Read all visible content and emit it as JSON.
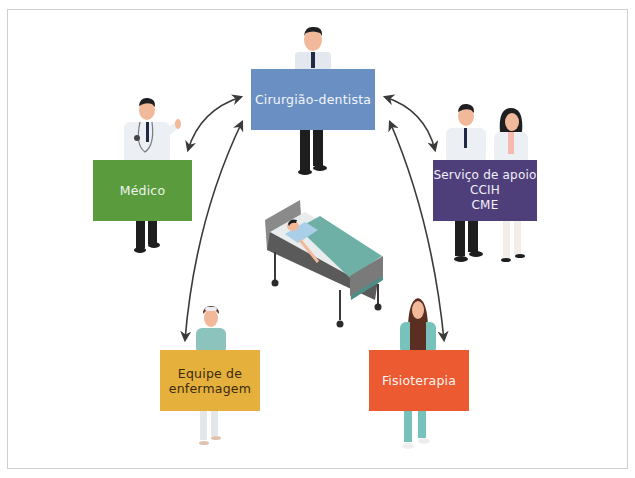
{
  "diagram": {
    "center": {
      "label": "Paciente no leito",
      "icon": "hospital-bed-icon"
    },
    "roles": [
      {
        "id": "dentist",
        "label_lines": [
          "Cirurgião-dentista"
        ],
        "color": "#6a8fc3"
      },
      {
        "id": "medico",
        "label_lines": [
          "Médico"
        ],
        "color": "#5a9b3e"
      },
      {
        "id": "apoio",
        "label_lines": [
          "Serviço de apoio",
          "CCIH",
          "CME"
        ],
        "color": "#4e3f7a"
      },
      {
        "id": "enfermagem",
        "label_lines": [
          "Equipe de",
          "enfermagem"
        ],
        "color": "#e6b03c"
      },
      {
        "id": "fisio",
        "label_lines": [
          "Fisioterapia"
        ],
        "color": "#ec5a32"
      }
    ],
    "connections": [
      {
        "from": "Cirurgião-dentista",
        "to": "Médico",
        "type": "bidirectional"
      },
      {
        "from": "Cirurgião-dentista",
        "to": "Serviço de apoio",
        "type": "bidirectional"
      },
      {
        "from": "Cirurgião-dentista",
        "to": "Equipe de enfermagem",
        "type": "bidirectional"
      },
      {
        "from": "Cirurgião-dentista",
        "to": "Fisioterapia",
        "type": "bidirectional"
      }
    ]
  }
}
